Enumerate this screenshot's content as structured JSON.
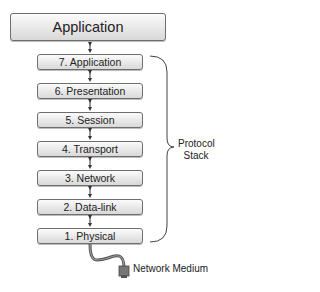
{
  "diagram": {
    "top_box": {
      "label": "Application"
    },
    "layers": [
      {
        "label": "7. Application"
      },
      {
        "label": "6. Presentation"
      },
      {
        "label": "5. Session"
      },
      {
        "label": "4. Transport"
      },
      {
        "label": "3. Network"
      },
      {
        "label": "2. Data-link"
      },
      {
        "label": "1. Physical"
      }
    ],
    "bracket_label_line1": "Protocol",
    "bracket_label_line2": "Stack",
    "medium_label": "Network Medium",
    "connector_icon": "double-arrow-icon",
    "cable_icon": "network-plug-icon",
    "colors": {
      "box_border": "#6e6e6e",
      "box_fill_top": "#fbfbfb",
      "box_fill_bottom": "#d9d9d9",
      "text": "#222222"
    }
  }
}
